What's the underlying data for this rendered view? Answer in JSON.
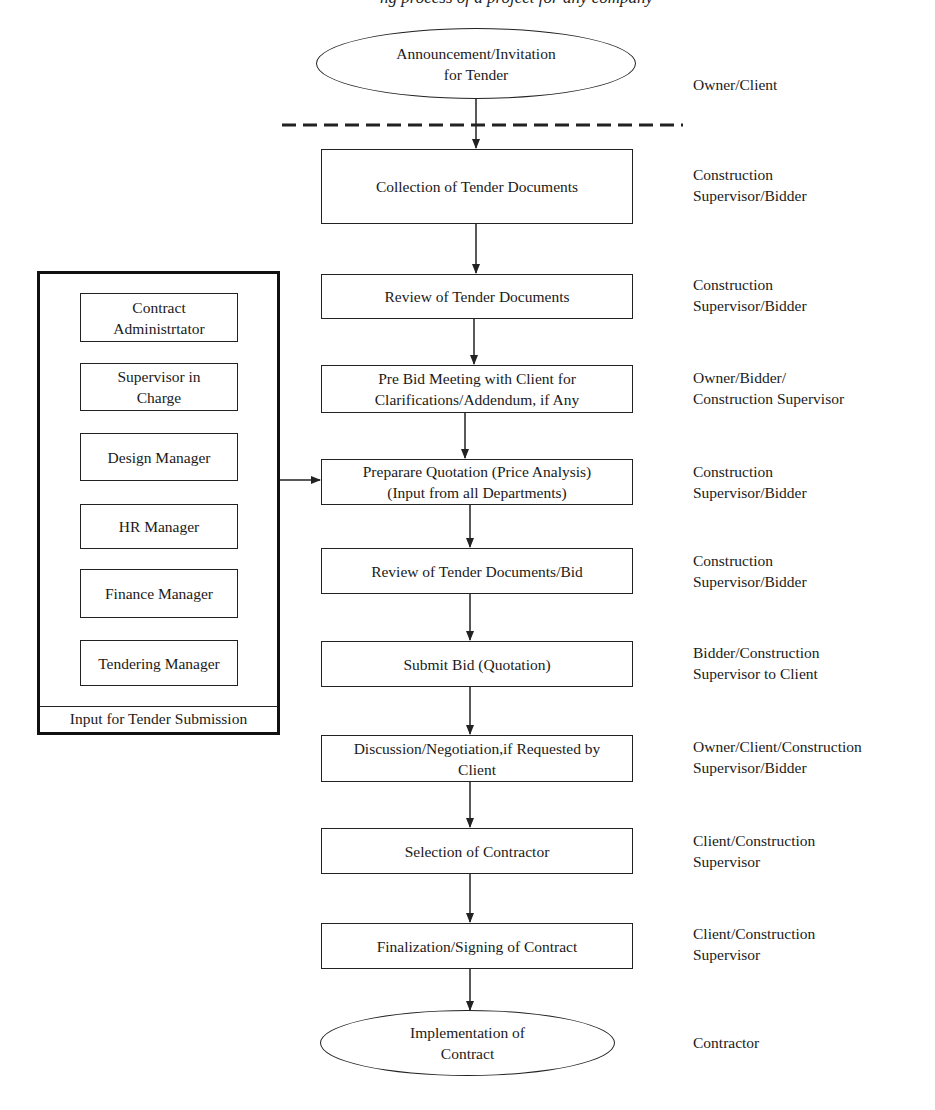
{
  "header": {
    "clipped_caption": "ng process of a project for any company"
  },
  "flow": {
    "start": "Announcement/Invitation\nfor Tender",
    "steps": [
      "Collection of Tender Documents",
      "Review of Tender Documents",
      "Pre Bid Meeting with Client for\nClarifications/Addendum, if Any",
      "Preparare Quotation (Price Analysis)\n(Input from all Departments)",
      "Review of Tender Documents/Bid",
      "Submit Bid (Quotation)",
      "Discussion/Negotiation,if Requested by\nClient",
      "Selection of Contractor",
      "Finalization/Signing of Contract"
    ],
    "end": "Implementation of\nContract"
  },
  "roles": {
    "start": "Owner/Client",
    "steps": [
      "Construction\nSupervisor/Bidder",
      "Construction\nSupervisor/Bidder",
      "Owner/Bidder/\nConstruction Supervisor",
      "Construction\nSupervisor/Bidder",
      "Construction\nSupervisor/Bidder",
      "Bidder/Construction\nSupervisor to Client",
      "Owner/Client/Construction\nSupervisor/Bidder",
      "Client/Construction\nSupervisor",
      "Client/Construction\nSupervisor"
    ],
    "end": "Contractor"
  },
  "input_panel": {
    "caption": "Input for Tender Submission",
    "departments": [
      "Contract\nAdministrtator",
      "Supervisor in\nCharge",
      "Design Manager",
      "HR Manager",
      "Finance Manager",
      "Tendering Manager"
    ]
  },
  "colors": {
    "line": "#222222",
    "background": "#ffffff"
  }
}
